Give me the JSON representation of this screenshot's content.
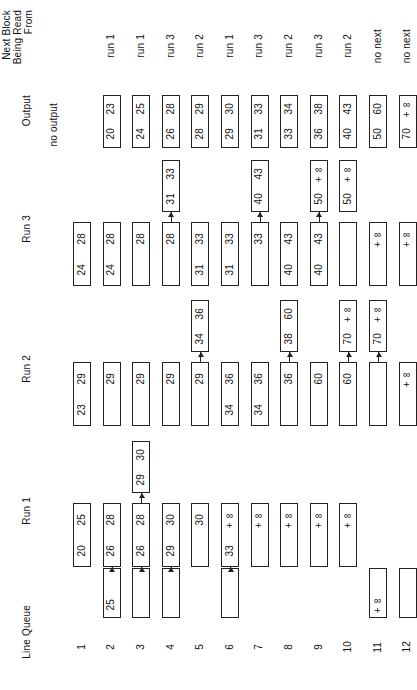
{
  "figure": {
    "row_labels": {
      "next_block": "Next Block\nBeing Read\nFrom",
      "next_block_l1": "Next Block",
      "next_block_l2": "Being Read",
      "next_block_l3": "From",
      "output": "Output",
      "run3": "Run 3",
      "run2": "Run 2",
      "run1": "Run 1",
      "line_queue": "Line Queue"
    },
    "line_numbers": [
      "1",
      "2",
      "3",
      "4",
      "5",
      "6",
      "7",
      "8",
      "9",
      "10",
      "11",
      "12"
    ],
    "next_block_values": [
      "run 1",
      "run 1",
      "run 3",
      "run 2",
      "run 1",
      "run 3",
      "run 2",
      "run 3",
      "run 2",
      "no next",
      "no next"
    ],
    "output_head": "no output",
    "output_boxes": [
      {
        "line": 2,
        "lo": "20",
        "hi": "23"
      },
      {
        "line": 3,
        "lo": "24",
        "hi": "25"
      },
      {
        "line": 4,
        "lo": "26",
        "hi": "28"
      },
      {
        "line": 5,
        "lo": "28",
        "hi": "29"
      },
      {
        "line": 6,
        "lo": "29",
        "hi": "30"
      },
      {
        "line": 7,
        "lo": "31",
        "hi": "33"
      },
      {
        "line": 8,
        "lo": "33",
        "hi": "34"
      },
      {
        "line": 9,
        "lo": "36",
        "hi": "38"
      },
      {
        "line": 10,
        "lo": "40",
        "hi": "43"
      },
      {
        "line": 11,
        "lo": "50",
        "hi": "60"
      },
      {
        "line": 12,
        "lo": "70",
        "hi": "+∞"
      }
    ],
    "run3_main": [
      {
        "line": 1,
        "lo": "24",
        "hi": "28"
      },
      {
        "line": 2,
        "lo": "24",
        "hi": "28"
      },
      {
        "line": 3,
        "lo": "",
        "hi": "28"
      },
      {
        "line": 4,
        "lo": "",
        "hi": "28"
      },
      {
        "line": 5,
        "lo": "31",
        "hi": "33"
      },
      {
        "line": 6,
        "lo": "31",
        "hi": "33"
      },
      {
        "line": 7,
        "lo": "",
        "hi": "33"
      },
      {
        "line": 8,
        "lo": "40",
        "hi": "43"
      },
      {
        "line": 9,
        "lo": "40",
        "hi": "43"
      },
      {
        "line": 10,
        "lo": "",
        "hi": ""
      },
      {
        "line": 11,
        "lo": "",
        "hi": "+∞"
      },
      {
        "line": 12,
        "lo": "",
        "hi": "+∞"
      }
    ],
    "run3_upper": [
      {
        "line": 4,
        "lo": "31",
        "hi": "33",
        "arrow": true
      },
      {
        "line": 7,
        "lo": "40",
        "hi": "43",
        "arrow": true
      },
      {
        "line": 9,
        "lo": "50",
        "hi": "+∞",
        "arrow": true
      },
      {
        "line": 10,
        "lo": "50",
        "hi": "+∞",
        "arrow": false
      }
    ],
    "run2_main": [
      {
        "line": 1,
        "lo": "23",
        "hi": "29"
      },
      {
        "line": 2,
        "lo": "",
        "hi": "29"
      },
      {
        "line": 3,
        "lo": "",
        "hi": "29"
      },
      {
        "line": 4,
        "lo": "",
        "hi": "29"
      },
      {
        "line": 5,
        "lo": "",
        "hi": "29"
      },
      {
        "line": 6,
        "lo": "34",
        "hi": "36"
      },
      {
        "line": 7,
        "lo": "34",
        "hi": "36"
      },
      {
        "line": 8,
        "lo": "",
        "hi": "36"
      },
      {
        "line": 9,
        "lo": "",
        "hi": "60"
      },
      {
        "line": 10,
        "lo": "",
        "hi": "60"
      },
      {
        "line": 11,
        "lo": "",
        "hi": ""
      },
      {
        "line": 12,
        "lo": "",
        "hi": "+∞"
      }
    ],
    "run2_upper": [
      {
        "line": 5,
        "lo": "34",
        "hi": "36",
        "arrow": true
      },
      {
        "line": 8,
        "lo": "38",
        "hi": "60",
        "arrow": true
      },
      {
        "line": 10,
        "lo": "70",
        "hi": "+∞",
        "arrow": true
      },
      {
        "line": 11,
        "lo": "70",
        "hi": "+∞",
        "arrow": true
      }
    ],
    "run1_main": [
      {
        "line": 1,
        "lo": "20",
        "hi": "25"
      },
      {
        "line": 2,
        "lo": "26",
        "hi": "28"
      },
      {
        "line": 3,
        "lo": "26",
        "hi": "28"
      },
      {
        "line": 4,
        "lo": "29",
        "hi": "30"
      },
      {
        "line": 5,
        "lo": "",
        "hi": "30"
      },
      {
        "line": 6,
        "lo": "33",
        "hi": "+∞"
      },
      {
        "line": 7,
        "lo": "",
        "hi": "+∞"
      },
      {
        "line": 8,
        "lo": "",
        "hi": "+∞"
      },
      {
        "line": 9,
        "lo": "",
        "hi": "+∞"
      },
      {
        "line": 10,
        "lo": "",
        "hi": "+∞"
      }
    ],
    "run1_upper": [
      {
        "line": 3,
        "lo": "29",
        "hi": "30",
        "arrow": true
      }
    ],
    "line_queue_boxes": [
      {
        "line": 2,
        "lo": "25",
        "hi": "",
        "arrow": true
      },
      {
        "line": 3,
        "lo": "",
        "hi": "",
        "arrow": true
      },
      {
        "line": 4,
        "lo": "",
        "hi": "",
        "arrow": true
      },
      {
        "line": 6,
        "lo": "",
        "hi": "",
        "arrow": true
      },
      {
        "line": 11,
        "lo": "+∞",
        "hi": "",
        "arrow": false
      },
      {
        "line": 12,
        "lo": "",
        "hi": "",
        "arrow": false
      }
    ],
    "colors": {
      "stroke": "#222222",
      "background": "#ffffff",
      "text": "#111111"
    }
  }
}
